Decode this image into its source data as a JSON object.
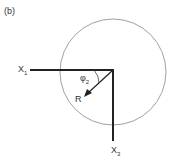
{
  "panel_label": "(b)",
  "labels": {
    "x1": "X",
    "x1_sub": "1",
    "x3": "X",
    "x3_sub": "3",
    "phi": "φ",
    "phi_sub": "2",
    "r": "R"
  },
  "colors": {
    "line": "#222222",
    "circle": "#888888"
  }
}
